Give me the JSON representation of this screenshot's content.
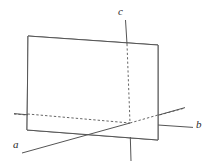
{
  "figure": {
    "background_color": "#ffffff",
    "stroke_color": "#555555",
    "dashed_stroke_color": "#555555",
    "label_color": "#2b2b2b",
    "canvas": {
      "width": 218,
      "height": 168
    },
    "origin": {
      "x": 130,
      "y": 123
    },
    "labels": {
      "axis_a": "a",
      "axis_b": "b",
      "axis_c": "c"
    },
    "label_positions": {
      "axis_a": {
        "x": 13,
        "y": 148
      },
      "axis_b": {
        "x": 196,
        "y": 128
      },
      "axis_c": {
        "x": 118,
        "y": 15
      }
    },
    "plane": {
      "name": "rectangular-plane",
      "corners": [
        {
          "x": 28,
          "y": 36
        },
        {
          "x": 158,
          "y": 45
        },
        {
          "x": 158,
          "y": 140
        },
        {
          "x": 27,
          "y": 130
        }
      ]
    },
    "axis_segments": {
      "a_visible_front": {
        "x1": 22,
        "y1": 153,
        "x2": 130,
        "y2": 123
      },
      "a_hidden_back": {
        "x1": 130,
        "y1": 123,
        "x2": 185,
        "y2": 108
      },
      "b_hidden_back": {
        "x1": 14,
        "y1": 114,
        "x2": 130,
        "y2": 123
      },
      "b_visible_front": {
        "x1": 130,
        "y1": 123,
        "x2": 193,
        "y2": 127
      },
      "c_visible_top": {
        "x1": 124,
        "y1": 20,
        "x2": 130,
        "y2": 123
      },
      "c_hidden_inside": {
        "x1": 127,
        "y1": 45,
        "x2": 130,
        "y2": 123
      },
      "c_visible_bottom": {
        "x1": 130,
        "y1": 123,
        "x2": 131,
        "y2": 161
      }
    }
  }
}
